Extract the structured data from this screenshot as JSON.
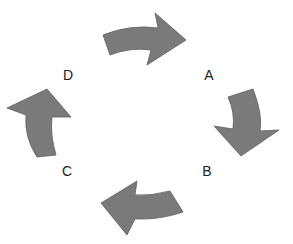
{
  "diagram": {
    "type": "cycle",
    "nodes": [
      {
        "id": "A",
        "label": "A"
      },
      {
        "id": "B",
        "label": "B"
      },
      {
        "id": "C",
        "label": "C"
      },
      {
        "id": "D",
        "label": "D"
      }
    ],
    "edges": [
      {
        "from": "D",
        "to": "A",
        "direction": "clockwise"
      },
      {
        "from": "A",
        "to": "B",
        "direction": "clockwise"
      },
      {
        "from": "B",
        "to": "C",
        "direction": "clockwise"
      },
      {
        "from": "C",
        "to": "D",
        "direction": "clockwise"
      }
    ],
    "colors": {
      "arrow_fill": "#7a7a7a",
      "arrow_stroke": "#5e5e5e",
      "label": "#222222",
      "background": "#ffffff"
    }
  }
}
